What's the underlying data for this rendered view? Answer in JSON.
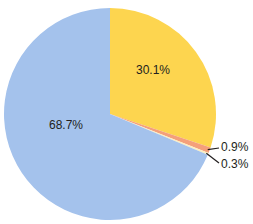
{
  "chart_data": {
    "type": "pie",
    "title": "",
    "start_angle_deg": 0,
    "direction": "clockwise",
    "slices": [
      {
        "label": "30.1%",
        "value": 30.1,
        "color": "#fdd54f"
      },
      {
        "label": "0.9%",
        "value": 0.9,
        "color": "#f4a07a"
      },
      {
        "label": "0.3%",
        "value": 0.3,
        "color": "#fbeec0"
      },
      {
        "label": "68.7%",
        "value": 68.7,
        "color": "#a4c2ec"
      }
    ],
    "labels": {
      "s0": "30.1%",
      "s1": "0.9%",
      "s2": "0.3%",
      "s3": "68.7%"
    }
  }
}
